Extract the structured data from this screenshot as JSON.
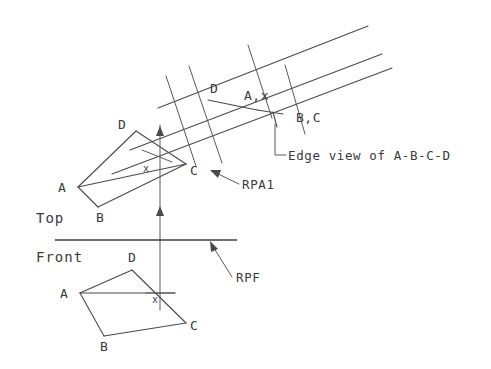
{
  "drawing": {
    "title": "Descriptive geometry auxiliary view construction",
    "background_color": "#ffffff",
    "line_color": "#4a4a4a",
    "width": 491,
    "height": 369
  },
  "view_labels": {
    "top": "Top",
    "front": "Front"
  },
  "annotations": {
    "edge_view": "Edge view of A-B-C-D",
    "rpa1": "RPA1",
    "rpf": "RPF"
  },
  "top_view": {
    "vertices": [
      {
        "label": "A",
        "x": 78,
        "y": 187
      },
      {
        "label": "B",
        "x": 98,
        "y": 207
      },
      {
        "label": "C",
        "x": 186,
        "y": 164
      },
      {
        "label": "D",
        "x": 136,
        "y": 131
      }
    ],
    "point_marker": "x"
  },
  "front_view": {
    "vertices": [
      {
        "label": "A",
        "x": 80,
        "y": 293
      },
      {
        "label": "B",
        "x": 104,
        "y": 336
      },
      {
        "label": "C",
        "x": 186,
        "y": 323
      },
      {
        "label": "D",
        "x": 132,
        "y": 270
      }
    ],
    "point_marker": "x"
  },
  "auxiliary_view": {
    "labels": [
      {
        "text": "D",
        "x": 212,
        "y": 89
      },
      {
        "text": "A,x",
        "x": 243,
        "y": 96
      },
      {
        "text": "B,C",
        "x": 295,
        "y": 118
      }
    ]
  }
}
